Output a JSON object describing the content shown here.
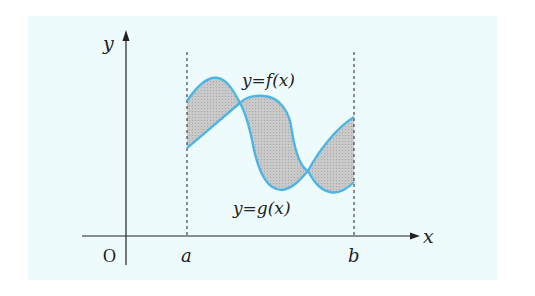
{
  "diagram": {
    "title": "",
    "background_color": "#eefbfd",
    "curve_color": "#4db5e6",
    "fill_color": "#c4c4c4",
    "axis_color": "#222222",
    "labels": {
      "y_axis": "y",
      "x_axis": "x",
      "origin": "O",
      "a": "a",
      "b": "b",
      "f_curve": "y=f(x)",
      "g_curve": "y=g(x)"
    },
    "elements": [
      {
        "type": "axis",
        "name": "x-axis",
        "label": "x"
      },
      {
        "type": "axis",
        "name": "y-axis",
        "label": "y"
      },
      {
        "type": "dashed-line",
        "name": "x=a"
      },
      {
        "type": "dashed-line",
        "name": "x=b"
      },
      {
        "type": "curve",
        "name": "f",
        "label": "y=f(x)"
      },
      {
        "type": "curve",
        "name": "g",
        "label": "y=g(x)"
      },
      {
        "type": "shaded-region",
        "name": "area between f and g on [a,b]"
      }
    ]
  }
}
